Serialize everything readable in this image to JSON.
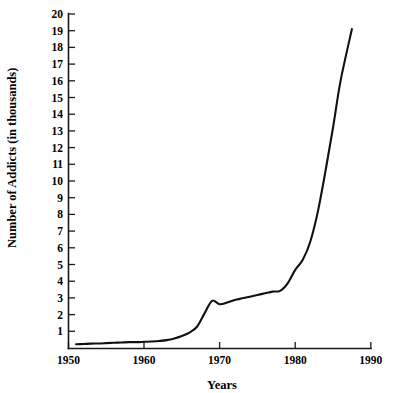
{
  "chart_data": {
    "type": "line",
    "title": "",
    "xlabel": "Years",
    "ylabel": "Number of Addicts (in thousands)",
    "xlim": [
      1950,
      1990
    ],
    "ylim": [
      0,
      20
    ],
    "grid": false,
    "legend": null,
    "xticks": [
      1950,
      1960,
      1970,
      1980,
      1990
    ],
    "xtick_labels": [
      "1950",
      "1960",
      "1970",
      "1980",
      "1990"
    ],
    "yticks": [
      1,
      2,
      3,
      4,
      5,
      6,
      7,
      8,
      9,
      10,
      11,
      12,
      13,
      14,
      15,
      16,
      17,
      18,
      19,
      20
    ],
    "ytick_labels": [
      "1",
      "2",
      "3",
      "4",
      "5",
      "6",
      "7",
      "8",
      "9",
      "10",
      "11",
      "12",
      "13",
      "14",
      "15",
      "16",
      "17",
      "18",
      "19",
      "20"
    ],
    "line_color": "#111111",
    "series": [
      {
        "name": "Number of Addicts",
        "x": [
          1951,
          1952,
          1953,
          1954,
          1955,
          1956,
          1957,
          1958,
          1959,
          1960,
          1961,
          1962,
          1963,
          1964,
          1965,
          1966,
          1967,
          1968,
          1969,
          1970,
          1971,
          1972,
          1973,
          1974,
          1975,
          1976,
          1977,
          1978,
          1979,
          1980,
          1981,
          1982,
          1983,
          1984,
          1985,
          1986,
          1987.5
        ],
        "y": [
          0.25,
          0.27,
          0.29,
          0.3,
          0.32,
          0.34,
          0.36,
          0.38,
          0.38,
          0.4,
          0.42,
          0.45,
          0.5,
          0.6,
          0.75,
          0.95,
          1.3,
          2.1,
          2.85,
          2.65,
          2.75,
          2.9,
          3.0,
          3.1,
          3.2,
          3.3,
          3.4,
          3.45,
          3.9,
          4.7,
          5.3,
          6.4,
          8.2,
          10.6,
          13.2,
          16.0,
          19.1
        ]
      }
    ]
  },
  "axis": {
    "y_axis_name": "y-axis",
    "x_axis_name": "x-axis"
  }
}
